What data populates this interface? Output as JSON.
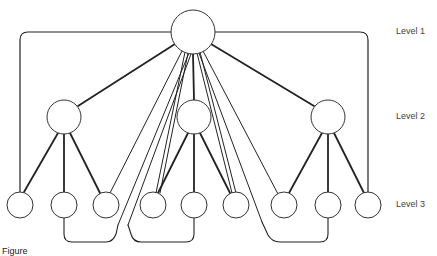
{
  "levels": [
    {
      "label": "Level 1",
      "y": 32
    },
    {
      "label": "Level 2",
      "y": 118
    },
    {
      "label": "Level 3",
      "y": 205
    }
  ],
  "nodes": {
    "root": {
      "x": 193,
      "y": 32,
      "r": 22
    },
    "level2": [
      {
        "x": 64,
        "y": 117,
        "r": 17
      },
      {
        "x": 194,
        "y": 117,
        "r": 17
      },
      {
        "x": 328,
        "y": 117,
        "r": 17
      }
    ],
    "level3": [
      {
        "x": 20,
        "y": 205,
        "r": 13
      },
      {
        "x": 64,
        "y": 205,
        "r": 13
      },
      {
        "x": 106,
        "y": 205,
        "r": 13
      },
      {
        "x": 153,
        "y": 205,
        "r": 13
      },
      {
        "x": 194,
        "y": 205,
        "r": 13
      },
      {
        "x": 236,
        "y": 205,
        "r": 13
      },
      {
        "x": 284,
        "y": 205,
        "r": 13
      },
      {
        "x": 328,
        "y": 205,
        "r": 13
      },
      {
        "x": 368,
        "y": 205,
        "r": 13
      }
    ]
  },
  "caption": "Figure"
}
